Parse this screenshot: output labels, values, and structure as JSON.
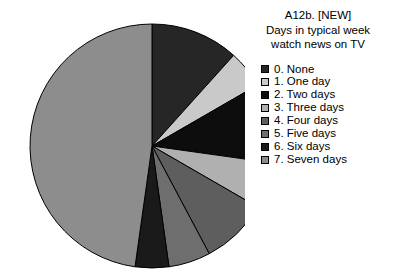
{
  "title": {
    "line1": "A12b. [NEW]",
    "line2": "Days in typical week",
    "line3": "watch news on TV",
    "full": "A12b. [NEW]\nDays in typical week\nwatch news on TV"
  },
  "legend": {
    "position": "right",
    "items": [
      {
        "label": "0. None",
        "color": "#262626"
      },
      {
        "label": "1. One day",
        "color": "#c9c9c9"
      },
      {
        "label": "2. Two days",
        "color": "#0d0d0d"
      },
      {
        "label": "3. Three days",
        "color": "#b0b0b0"
      },
      {
        "label": "4. Four days",
        "color": "#5e5e5e"
      },
      {
        "label": "5. Five days",
        "color": "#6e6e6e"
      },
      {
        "label": "6. Six days",
        "color": "#1a1a1a"
      },
      {
        "label": "7. Seven days",
        "color": "#8d8d8d"
      }
    ]
  },
  "chart_data": {
    "type": "pie",
    "title": "A12b. [NEW] Days in typical week watch news on TV",
    "xlabel": "",
    "ylabel": "",
    "start_angle_deg": 0,
    "direction": "clockwise",
    "grid": false,
    "legend_position": "right",
    "categories": [
      "0. None",
      "1. One day",
      "2. Two days",
      "3. Three days",
      "4. Four days",
      "5. Five days",
      "6. Six days",
      "7. Seven days"
    ],
    "values": [
      11.7,
      5.0,
      10.6,
      6.1,
      8.9,
      5.6,
      4.4,
      47.8
    ],
    "colors": [
      "#262626",
      "#c9c9c9",
      "#0d0d0d",
      "#b0b0b0",
      "#5e5e5e",
      "#6e6e6e",
      "#1a1a1a",
      "#8d8d8d"
    ],
    "slice_angles_deg": [
      {
        "category": "0. None",
        "start": 0,
        "end": 42
      },
      {
        "category": "1. One day",
        "start": 42,
        "end": 60
      },
      {
        "category": "2. Two days",
        "start": 60,
        "end": 98
      },
      {
        "category": "3. Three days",
        "start": 98,
        "end": 120
      },
      {
        "category": "4. Four days",
        "start": 120,
        "end": 152
      },
      {
        "category": "5. Five days",
        "start": 152,
        "end": 172
      },
      {
        "category": "6. Six days",
        "start": 172,
        "end": 188
      },
      {
        "category": "7. Seven days",
        "start": 188,
        "end": 360
      }
    ]
  }
}
